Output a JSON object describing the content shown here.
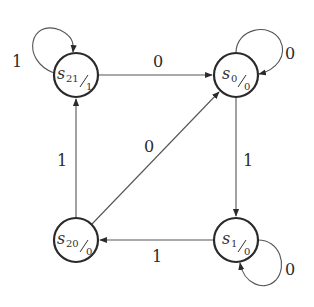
{
  "diagram": {
    "type": "state-machine (Moore)",
    "states": [
      {
        "id": "s21",
        "name": "s",
        "sub": "21",
        "output": "1",
        "cx": 76,
        "cy": 75
      },
      {
        "id": "s0",
        "name": "s",
        "sub": "0",
        "output": "0",
        "cx": 236,
        "cy": 75
      },
      {
        "id": "s20",
        "name": "s",
        "sub": "20",
        "output": "0",
        "cx": 76,
        "cy": 240
      },
      {
        "id": "s1",
        "name": "s",
        "sub": "1",
        "output": "0",
        "cx": 236,
        "cy": 240
      }
    ],
    "transitions": [
      {
        "from": "s21",
        "to": "s21",
        "label": "1"
      },
      {
        "from": "s21",
        "to": "s0",
        "label": "0"
      },
      {
        "from": "s0",
        "to": "s0",
        "label": "0"
      },
      {
        "from": "s0",
        "to": "s1",
        "label": "1"
      },
      {
        "from": "s1",
        "to": "s1",
        "label": "0"
      },
      {
        "from": "s1",
        "to": "s20",
        "label": "1"
      },
      {
        "from": "s20",
        "to": "s21",
        "label": "1"
      },
      {
        "from": "s20",
        "to": "s0",
        "label": "0"
      }
    ],
    "colors": {
      "stroke": "#2a2a2a",
      "edge": "#555555",
      "background": "#ffffff"
    }
  }
}
